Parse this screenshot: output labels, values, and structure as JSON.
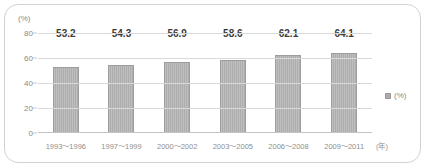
{
  "chart_data": {
    "type": "bar",
    "title": "",
    "xlabel": "(年)",
    "ylabel": "(%)",
    "categories": [
      "1993～1996",
      "1997～1999",
      "2000～2002",
      "2003～2005",
      "2006～2008",
      "2009～2011"
    ],
    "values": [
      53.2,
      54.3,
      56.9,
      58.6,
      62.1,
      64.1
    ],
    "value_labels": [
      "53.2",
      "54.3",
      "56.9",
      "58.6",
      "62.1",
      "64.1"
    ],
    "series": [
      {
        "name": "(%)",
        "values": [
          53.2,
          54.3,
          56.9,
          58.6,
          62.1,
          64.1
        ]
      }
    ],
    "ylim": [
      0,
      80
    ],
    "yticks": [
      0,
      20,
      40,
      60,
      80
    ],
    "ytick_labels": [
      "0",
      "20",
      "40",
      "60",
      "80"
    ],
    "grid": true,
    "legend_position": "right",
    "legend_entries": [
      "(%)"
    ],
    "bar_color": "#adadad",
    "grid_color": "#d9d9d9",
    "text_color": "#8a8a8a",
    "value_label_color": "#3b3b3b"
  },
  "axes": {
    "unit_label": "(%)",
    "x_unit_label": "(年)"
  },
  "legend": {
    "marker_name": "square-marker",
    "label": "(%)"
  }
}
